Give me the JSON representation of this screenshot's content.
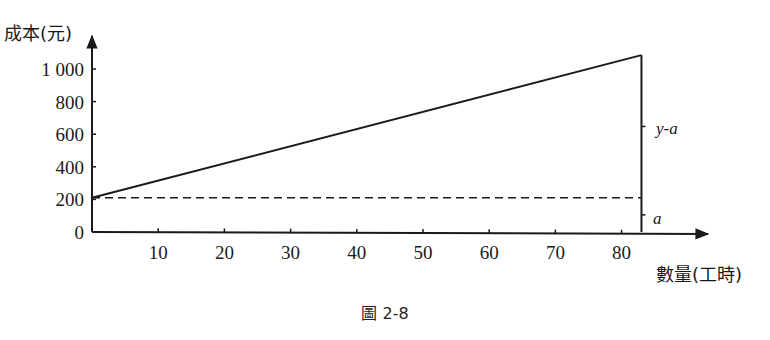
{
  "chart_data": {
    "type": "line",
    "title": "",
    "caption": "圖 2-8",
    "xlabel": "數量(工時)",
    "ylabel": "成本(元)",
    "xlim": [
      0,
      90
    ],
    "ylim": [
      0,
      1100
    ],
    "x_ticks": [
      10,
      20,
      30,
      40,
      50,
      60,
      70,
      80
    ],
    "y_ticks": [
      0,
      200,
      400,
      600,
      800,
      1000
    ],
    "y_tick_labels": [
      "0",
      "200",
      "400",
      "600",
      "800",
      "1 000"
    ],
    "grid": false,
    "legend": null,
    "series": [
      {
        "name": "總成本 y",
        "style": "solid",
        "x": [
          0,
          83
        ],
        "y": [
          210,
          1085
        ]
      },
      {
        "name": "固定成本 a",
        "style": "dashed",
        "x": [
          0,
          83
        ],
        "y": [
          210,
          210
        ]
      }
    ],
    "vertical_marker": {
      "x": 83,
      "y_from": 0,
      "y_to": 1085
    },
    "annotations": [
      {
        "text": "y-a",
        "position": "right of vertical marker, between a and y"
      },
      {
        "text": "a",
        "position": "right of vertical marker, between 0 and a"
      }
    ]
  },
  "labels": {
    "y_axis_title": "成本(元)",
    "x_axis_title": "數量(工時)",
    "annot_y_minus_a": "y-a",
    "annot_a": "a",
    "caption": "圖 2-8"
  }
}
